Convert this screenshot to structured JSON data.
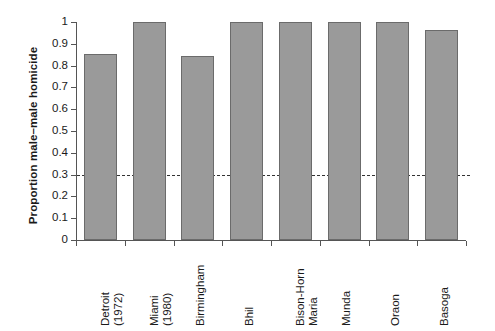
{
  "chart_data": {
    "type": "bar",
    "title": "",
    "xlabel": "",
    "ylabel": "Proportion male–male homicide",
    "categories": [
      "Detroit (1972)",
      "Miami (1980)",
      "Birmingham",
      "Bhil",
      "Bison-Horn Maria",
      "Munda",
      "Oraon",
      "Basoga"
    ],
    "category_lines": [
      [
        "Detroit",
        "(1972)"
      ],
      [
        "Miami",
        "(1980)"
      ],
      [
        "Birmingham"
      ],
      [
        "Bhil"
      ],
      [
        "Bison-Horn",
        "Maria"
      ],
      [
        "Munda"
      ],
      [
        "Oraon"
      ],
      [
        "Basoga"
      ]
    ],
    "values": [
      0.855,
      1.0,
      0.845,
      1.0,
      1.0,
      1.0,
      1.0,
      0.965
    ],
    "ylim": [
      0,
      1
    ],
    "ytick_values": [
      0,
      0.1,
      0.2,
      0.3,
      0.4,
      0.5,
      0.6,
      0.7,
      0.8,
      0.9,
      1
    ],
    "ytick_labels": [
      "0",
      "0.1",
      "0.2",
      "0.3",
      "0.4",
      "0.5",
      "0.6",
      "0.7",
      "0.8",
      "0.9",
      "1"
    ],
    "grid": false,
    "legend": null,
    "annotations": [
      {
        "name": "reference-line",
        "type": "hline",
        "value": 0.3,
        "style": "dashed"
      }
    ],
    "colors": {
      "bar_fill": "#9a9a9a",
      "bar_edge": "#6b6b6b",
      "axis": "#555555",
      "text": "#1a1a1a",
      "reference_line": "#333333",
      "background": "#ffffff"
    }
  }
}
